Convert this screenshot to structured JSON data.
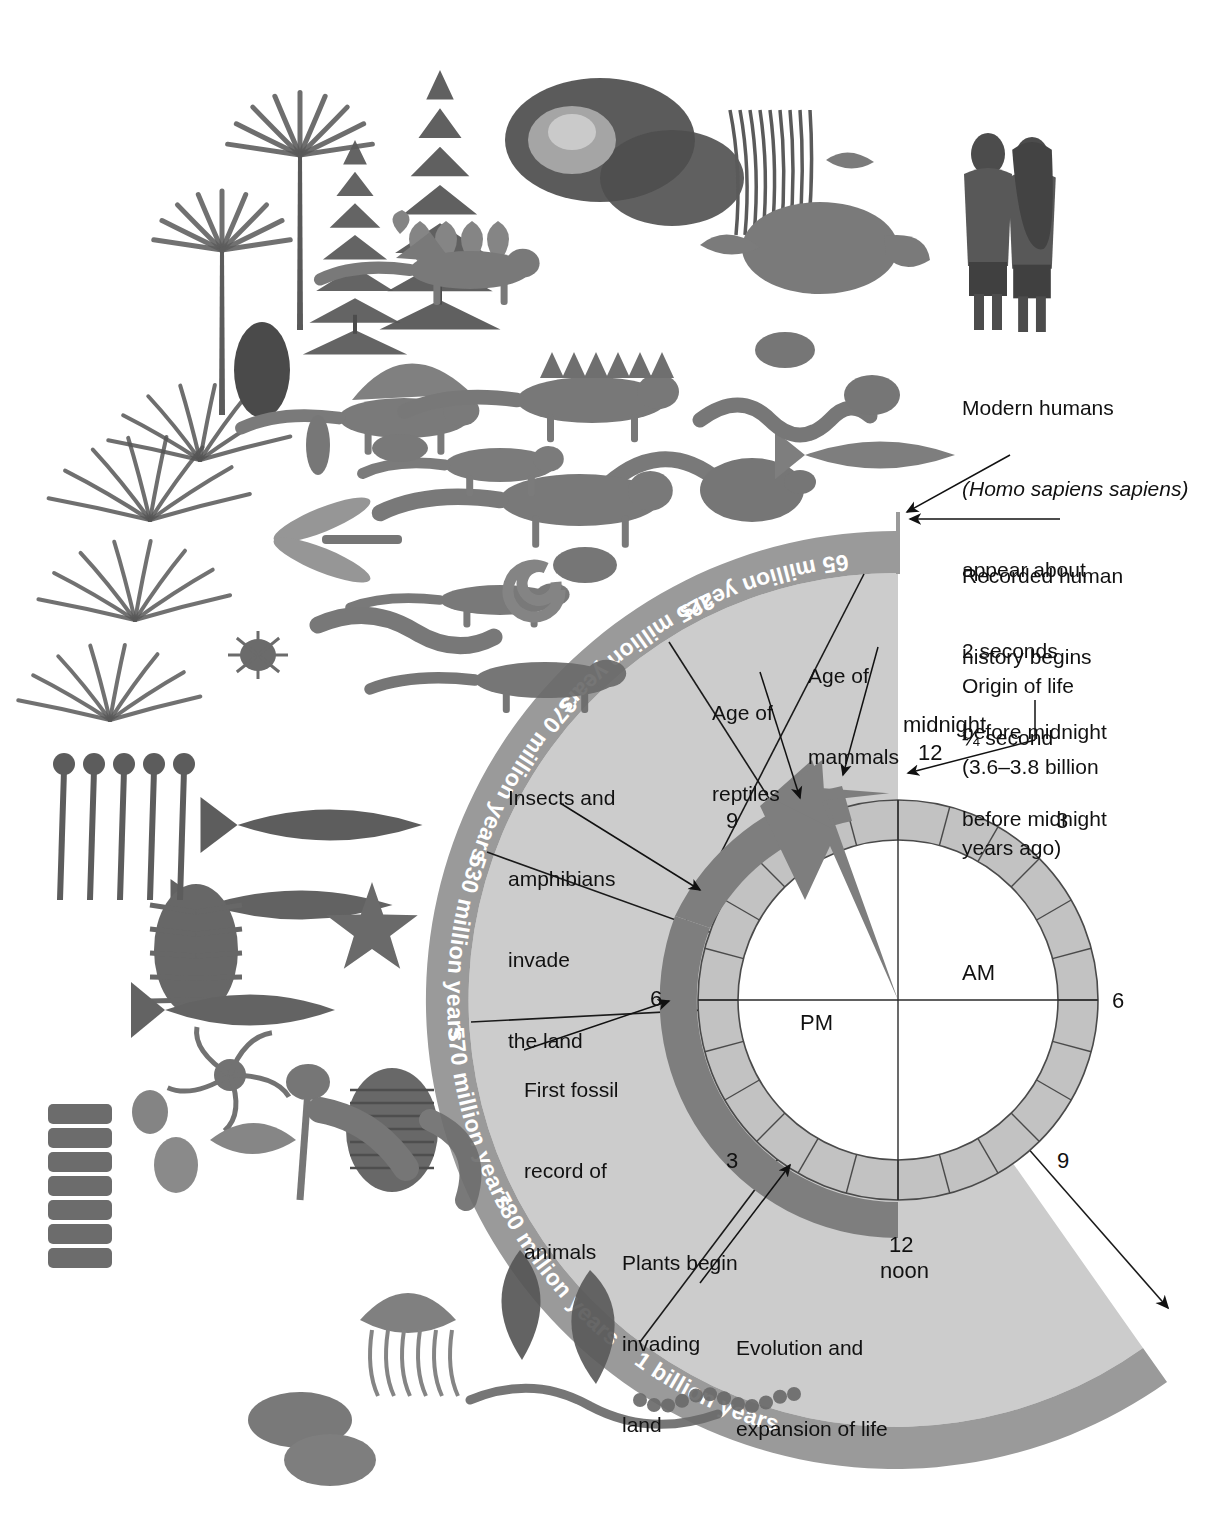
{
  "figure": {
    "type": "radial-timeline-clock",
    "colors": {
      "page_background": "#ffffff",
      "outer_band": "#9a9a9a",
      "outer_band_text": "#ffffff",
      "sector_fill": "#c9c9c9",
      "arrow_band": "#808080",
      "hour_ring": "#c2c2c2",
      "ring_stroke": "#5a5a5a",
      "dial_face": "#ffffff",
      "line": "#1a1a1a",
      "text": "#111111"
    }
  },
  "outer_band_labels": [
    {
      "name": "65-million-years",
      "text": "65 million years"
    },
    {
      "name": "225-million-years",
      "text": "225 million years"
    },
    {
      "name": "370-million-years",
      "text": "370 million years"
    },
    {
      "name": "530-million-years",
      "text": "530 million years"
    },
    {
      "name": "570-million-years",
      "text": "570 million years"
    },
    {
      "name": "780-million-years",
      "text": "780 million years"
    },
    {
      "name": "1-billion-years",
      "text": "1 billion years"
    }
  ],
  "sector_labels": [
    {
      "name": "age-of-mammals",
      "lines": [
        "Age of",
        "mammals"
      ]
    },
    {
      "name": "age-of-reptiles",
      "lines": [
        "Age of",
        "reptiles"
      ]
    },
    {
      "name": "insects-amphibians-invade-land",
      "lines": [
        "Insects and",
        "amphibians",
        "invade",
        "the land"
      ]
    },
    {
      "name": "first-fossil-record-of-animals",
      "lines": [
        "First fossil",
        "record of",
        "animals"
      ]
    },
    {
      "name": "plants-begin-invading-land",
      "lines": [
        "Plants begin",
        "invading",
        "land"
      ]
    },
    {
      "name": "evolution-and-expansion-of-life",
      "lines": [
        "Evolution and",
        "expansion of life"
      ]
    }
  ],
  "callouts": [
    {
      "name": "modern-humans",
      "lines": [
        "Modern humans",
        "(Homo sapiens sapiens)",
        "appear about",
        "2 seconds",
        "before midnight"
      ],
      "italic_part": "Homo sapiens sapiens"
    },
    {
      "name": "recorded-human-history",
      "lines": [
        "Recorded human",
        "history begins",
        "¼ second",
        "before midnight"
      ]
    },
    {
      "name": "origin-of-life",
      "lines": [
        "Origin of life",
        "(3.6–3.8 billion",
        "years ago)"
      ]
    }
  ],
  "clock": {
    "midnight_label": "midnight",
    "midnight_number": "12",
    "noon_number": "12",
    "noon_label": "noon",
    "am_label": "AM",
    "pm_label": "PM",
    "hour_ticks": [
      "3",
      "6",
      "9",
      "3",
      "6",
      "9"
    ],
    "tick_top_right": "3",
    "tick_right": "6",
    "tick_bottom_right": "9",
    "tick_bottom_left": "3",
    "tick_left": "6",
    "tick_top_left": "9",
    "hour_segments": 24
  },
  "illustration": {
    "name": "prehistoric-life-montage",
    "description": "Grayscale airbrush montage of prehistoric plants and animals arranged along the upper-left quadrant: conifers, cycads, ginkgo, magnolia, tree ferns, horsetails, dinosaurs (Dimetrodon, Stegosaurus, sauropod, theropod), pterosaurs, early mammals, snake, turtle, whale, amphibians, dragonfly, millipede, cockroach, ammonite, trilobite, eurypterid, starfish, crinoid, jellyfish, sponges, worms, algae, and two modern humans at top right.",
    "human_figures": "two modern humans standing"
  }
}
